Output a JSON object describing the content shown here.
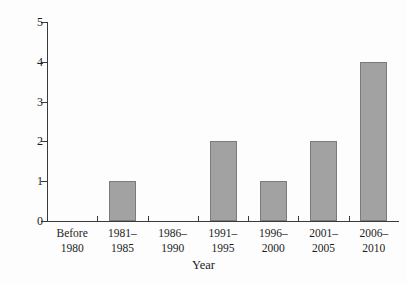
{
  "chart_data": {
    "type": "bar",
    "title": "",
    "xlabel": "Year",
    "ylabel": "Number of 147 maximum breaks",
    "categories": [
      "Before\n1980",
      "1981–\n1985",
      "1986–\n1990",
      "1991–\n1995",
      "1996–\n2000",
      "2001–\n2005",
      "2006–\n2010"
    ],
    "values": [
      0,
      1,
      0,
      2,
      1,
      2,
      4
    ],
    "ylim": [
      0,
      5
    ],
    "yticks": [
      "0",
      "1",
      "2",
      "3",
      "4",
      "5"
    ],
    "grid": false,
    "legend": false,
    "bar_color": "#a2a2a2",
    "bar_edge_color": "#7b7b7b",
    "axis_color": "#3a3a3a",
    "background": "#fdfdfd"
  }
}
